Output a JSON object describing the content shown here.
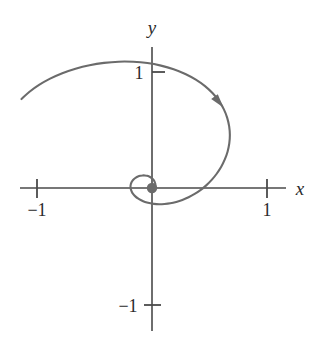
{
  "figure": {
    "title": "",
    "background_color": "#ffffff"
  },
  "chart_data": {
    "type": "line",
    "title": "",
    "subtitle": "",
    "xlabel": "x",
    "ylabel": "y",
    "xlim": [
      -1.15,
      1.15
    ],
    "ylim": [
      -1.22,
      1.22
    ],
    "grid": false,
    "legend": null,
    "axis_color": "#4a4a4a",
    "curve_color": "#6b6b6b",
    "marker_color": "#6b6b6b",
    "x_ticks": [
      {
        "value": -1,
        "label": "−1"
      },
      {
        "value": 1,
        "label": "1"
      }
    ],
    "y_ticks": [
      {
        "value": 1,
        "label": "1"
      },
      {
        "value": -1,
        "label": "−1"
      }
    ],
    "annotations": [
      {
        "name": "direction-arrow",
        "kind": "arrowhead",
        "x": 0.33,
        "y": 0.56,
        "note": "arrow along curve indicating clockwise inward motion"
      },
      {
        "name": "origin-point",
        "kind": "filled-dot",
        "x": 0,
        "y": 0,
        "note": "limit point of the spiral at the origin"
      }
    ],
    "series": [
      {
        "name": "spiral",
        "kind": "parametric-polar",
        "equation": "r = a*e^(-b*theta)",
        "points": [
          [
            -1.135,
            0.767
          ],
          [
            -1.065,
            0.83
          ],
          [
            -0.982,
            0.889
          ],
          [
            -0.886,
            0.943
          ],
          [
            -0.78,
            0.99
          ],
          [
            -0.665,
            1.029
          ],
          [
            -0.543,
            1.059
          ],
          [
            -0.417,
            1.079
          ],
          [
            -0.29,
            1.089
          ],
          [
            -0.163,
            1.088
          ],
          [
            -0.04,
            1.077
          ],
          [
            0.078,
            1.055
          ],
          [
            0.188,
            1.024
          ],
          [
            0.29,
            0.983
          ],
          [
            0.381,
            0.934
          ],
          [
            0.461,
            0.878
          ],
          [
            0.528,
            0.816
          ],
          [
            0.583,
            0.749
          ],
          [
            0.625,
            0.678
          ],
          [
            0.654,
            0.605
          ],
          [
            0.671,
            0.531
          ],
          [
            0.677,
            0.457
          ],
          [
            0.672,
            0.384
          ],
          [
            0.657,
            0.313
          ],
          [
            0.633,
            0.246
          ],
          [
            0.602,
            0.183
          ],
          [
            0.564,
            0.125
          ],
          [
            0.521,
            0.072
          ],
          [
            0.474,
            0.025
          ],
          [
            0.424,
            -0.016
          ],
          [
            0.371,
            -0.051
          ],
          [
            0.318,
            -0.08
          ],
          [
            0.264,
            -0.103
          ],
          [
            0.211,
            -0.12
          ],
          [
            0.159,
            -0.132
          ],
          [
            0.109,
            -0.138
          ],
          [
            0.062,
            -0.14
          ],
          [
            0.017,
            -0.137
          ],
          [
            -0.024,
            -0.13
          ],
          [
            -0.061,
            -0.12
          ],
          [
            -0.094,
            -0.106
          ],
          [
            -0.122,
            -0.09
          ],
          [
            -0.145,
            -0.072
          ],
          [
            -0.163,
            -0.053
          ],
          [
            -0.176,
            -0.032
          ],
          [
            -0.184,
            -0.011
          ],
          [
            -0.187,
            0.009
          ],
          [
            -0.185,
            0.029
          ],
          [
            -0.179,
            0.047
          ],
          [
            -0.169,
            0.064
          ],
          [
            -0.156,
            0.078
          ],
          [
            -0.14,
            0.09
          ],
          [
            -0.122,
            0.099
          ],
          [
            -0.102,
            0.105
          ],
          [
            -0.082,
            0.108
          ],
          [
            -0.062,
            0.108
          ],
          [
            -0.043,
            0.105
          ],
          [
            -0.025,
            0.099
          ],
          [
            -0.009,
            0.09
          ],
          [
            0.004,
            0.079
          ],
          [
            0.015,
            0.067
          ],
          [
            0.023,
            0.053
          ],
          [
            0.028,
            0.039
          ],
          [
            0.03,
            0.025
          ],
          [
            0.029,
            0.012
          ],
          [
            0.026,
            0.0
          ],
          [
            0.02,
            -0.01
          ],
          [
            0.013,
            -0.018
          ],
          [
            0.005,
            -0.023
          ],
          [
            -0.004,
            -0.025
          ],
          [
            -0.012,
            -0.024
          ],
          [
            -0.019,
            -0.021
          ],
          [
            -0.024,
            -0.015
          ],
          [
            -0.027,
            -0.008
          ],
          [
            -0.027,
            -0.001
          ],
          [
            -0.025,
            0.006
          ],
          [
            -0.021,
            0.011
          ],
          [
            -0.015,
            0.014
          ],
          [
            -0.009,
            0.015
          ],
          [
            -0.003,
            0.013
          ],
          [
            0.002,
            0.009
          ],
          [
            0.005,
            0.004
          ],
          [
            0.006,
            -0.001
          ],
          [
            0.004,
            -0.005
          ],
          [
            0.001,
            -0.007
          ],
          [
            -0.002,
            -0.006
          ],
          [
            -0.004,
            -0.003
          ],
          [
            -0.004,
            0.001
          ],
          [
            -0.002,
            0.003
          ],
          [
            0.0,
            0.003
          ],
          [
            0.001,
            0.001
          ],
          [
            0.0,
            0.0
          ]
        ]
      }
    ]
  }
}
